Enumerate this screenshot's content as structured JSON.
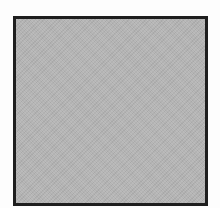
{
  "swatch": {
    "shape": "square",
    "fill_color": "#b3b3b3",
    "border_color": "#1e1e1e",
    "texture": "fine-grain-noise"
  },
  "background_color": "#ffffff"
}
